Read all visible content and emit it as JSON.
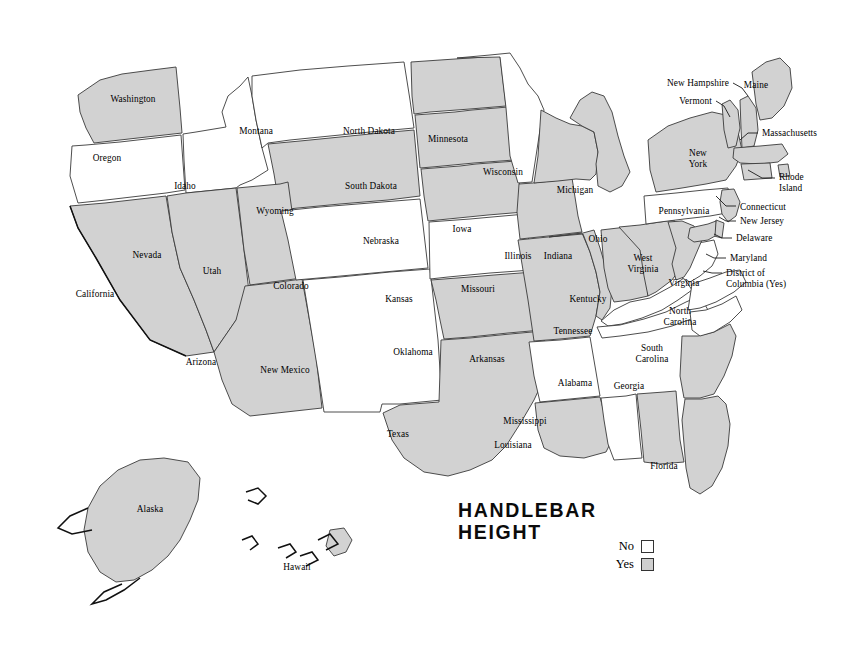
{
  "title": {
    "line1": "HANDLEBAR",
    "line2": "HEIGHT"
  },
  "legend": {
    "no_label": "No",
    "yes_label": "Yes",
    "no_color": "#ffffff",
    "yes_color": "#cfcfcf"
  },
  "colors": {
    "yes_fill": "#d2d2d2",
    "no_fill": "#ffffff",
    "border": "#3a3a3a",
    "background": "#ffffff"
  },
  "map_data": {
    "type": "choropleth",
    "region": "United States",
    "categories": [
      "No",
      "Yes"
    ],
    "states": [
      {
        "code": "WA",
        "label": "Washington",
        "value": "Yes",
        "lx": 133,
        "ly": 94,
        "align": "c"
      },
      {
        "code": "OR",
        "label": "Oregon",
        "value": "No",
        "lx": 107,
        "ly": 153,
        "align": "c"
      },
      {
        "code": "ID",
        "label": "Idaho",
        "value": "No",
        "lx": 185,
        "ly": 181,
        "align": "c"
      },
      {
        "code": "MT",
        "label": "Montana",
        "value": "No",
        "lx": 256,
        "ly": 126,
        "align": "c"
      },
      {
        "code": "WY",
        "label": "Wyoming",
        "value": "Yes",
        "lx": 275,
        "ly": 206,
        "align": "c"
      },
      {
        "code": "CA",
        "label": "California",
        "value": "Yes",
        "lx": 95,
        "ly": 289,
        "align": "c"
      },
      {
        "code": "NV",
        "label": "Nevada",
        "value": "Yes",
        "lx": 147,
        "ly": 250,
        "align": "c"
      },
      {
        "code": "UT",
        "label": "Utah",
        "value": "Yes",
        "lx": 212,
        "ly": 266,
        "align": "c"
      },
      {
        "code": "AZ",
        "label": "Arizona",
        "value": "Yes",
        "lx": 201,
        "ly": 357,
        "align": "c"
      },
      {
        "code": "NM",
        "label": "New Mexico",
        "value": "No",
        "lx": 285,
        "ly": 365,
        "align": "c"
      },
      {
        "code": "CO",
        "label": "Colorado",
        "value": "No",
        "lx": 291,
        "ly": 281,
        "align": "c"
      },
      {
        "code": "ND",
        "label": "North Dakota",
        "value": "Yes",
        "lx": 369,
        "ly": 126,
        "align": "c"
      },
      {
        "code": "SD",
        "label": "South Dakota",
        "value": "Yes",
        "lx": 371,
        "ly": 181,
        "align": "c"
      },
      {
        "code": "NE",
        "label": "Nebraska",
        "value": "Yes",
        "lx": 381,
        "ly": 236,
        "align": "c"
      },
      {
        "code": "KS",
        "label": "Kansas",
        "value": "No",
        "lx": 399,
        "ly": 294,
        "align": "c"
      },
      {
        "code": "OK",
        "label": "Oklahoma",
        "value": "Yes",
        "lx": 413,
        "ly": 347,
        "align": "c"
      },
      {
        "code": "TX",
        "label": "Texas",
        "value": "Yes",
        "lx": 398,
        "ly": 429,
        "align": "c"
      },
      {
        "code": "MN",
        "label": "Minnesota",
        "value": "No",
        "lx": 448,
        "ly": 134,
        "align": "c"
      },
      {
        "code": "IA",
        "label": "Iowa",
        "value": "Yes",
        "lx": 462,
        "ly": 224,
        "align": "c"
      },
      {
        "code": "MO",
        "label": "Missouri",
        "value": "Yes",
        "lx": 478,
        "ly": 284,
        "align": "c"
      },
      {
        "code": "AR",
        "label": "Arkansas",
        "value": "No",
        "lx": 487,
        "ly": 354,
        "align": "c"
      },
      {
        "code": "LA",
        "label": "Louisiana",
        "value": "Yes",
        "lx": 513,
        "ly": 440,
        "align": "c"
      },
      {
        "code": "MS",
        "label": "Mississippi",
        "value": "No",
        "lx": 525,
        "ly": 416,
        "align": "c"
      },
      {
        "code": "WI",
        "label": "Wisconsin",
        "value": "Yes",
        "lx": 503,
        "ly": 167,
        "align": "c"
      },
      {
        "code": "IL",
        "label": "Illinois",
        "value": "Yes",
        "lx": 518,
        "ly": 251,
        "align": "c"
      },
      {
        "code": "MI",
        "label": "Michigan",
        "value": "Yes",
        "lx": 575,
        "ly": 185,
        "align": "c"
      },
      {
        "code": "IN",
        "label": "Indiana",
        "value": "Yes",
        "lx": 558,
        "ly": 251,
        "align": "c"
      },
      {
        "code": "OH",
        "label": "Ohio",
        "value": "Yes",
        "lx": 598,
        "ly": 234,
        "align": "c"
      },
      {
        "code": "KY",
        "label": "Kentucky",
        "value": "No",
        "lx": 588,
        "ly": 294,
        "align": "c"
      },
      {
        "code": "TN",
        "label": "Tennessee",
        "value": "No",
        "lx": 573,
        "ly": 326,
        "align": "c"
      },
      {
        "code": "AL",
        "label": "Alabama",
        "value": "Yes",
        "lx": 575,
        "ly": 378,
        "align": "c"
      },
      {
        "code": "GA",
        "label": "Georgia",
        "value": "Yes",
        "lx": 629,
        "ly": 381,
        "align": "c"
      },
      {
        "code": "FL",
        "label": "Florida",
        "value": "Yes",
        "lx": 664,
        "ly": 461,
        "align": "c"
      },
      {
        "code": "SC",
        "label": "South\nCarolina",
        "value": "No",
        "lx": 652,
        "ly": 343,
        "align": "c"
      },
      {
        "code": "NC",
        "label": "North\nCarolina",
        "value": "No",
        "lx": 680,
        "ly": 306,
        "align": "c"
      },
      {
        "code": "VA",
        "label": "Virginia",
        "value": "No",
        "lx": 684,
        "ly": 278,
        "align": "c"
      },
      {
        "code": "WV",
        "label": "West\nVirginia",
        "value": "Yes",
        "lx": 643,
        "ly": 253,
        "align": "c"
      },
      {
        "code": "PA",
        "label": "Pennsylvania",
        "value": "No",
        "lx": 684,
        "ly": 206,
        "align": "c"
      },
      {
        "code": "NY",
        "label": "New\nYork",
        "value": "Yes",
        "lx": 698,
        "ly": 148,
        "align": "c"
      },
      {
        "code": "AK",
        "label": "Alaska",
        "value": "Yes",
        "lx": 150,
        "ly": 504,
        "align": "c"
      },
      {
        "code": "HI",
        "label": "Hawaii",
        "value": "Yes",
        "lx": 297,
        "ly": 562,
        "align": "c"
      }
    ],
    "callouts": [
      {
        "code": "NH",
        "label": "New Hampshire",
        "value": "Yes",
        "lx": 729,
        "ly": 78,
        "align": "r",
        "lead": "M733,83 L742,88 L748,96"
      },
      {
        "code": "VT",
        "label": "Vermont",
        "value": "Yes",
        "lx": 712,
        "ly": 96,
        "align": "r",
        "lead": "M716,101 L724,106 L730,117"
      },
      {
        "code": "ME",
        "label": "Maine",
        "value": "Yes",
        "lx": 756,
        "ly": 80,
        "align": "c"
      },
      {
        "code": "MA",
        "label": "Massachusetts",
        "value": "Yes",
        "lx": 762,
        "ly": 128,
        "align": "l",
        "lead": "M758,133 L748,133 L740,140"
      },
      {
        "code": "RI",
        "label": "Rhode\nIsland",
        "value": "Yes",
        "lx": 779,
        "ly": 172,
        "align": "l",
        "lead": "M775,178 L762,178 L748,170"
      },
      {
        "code": "CT",
        "label": "Connecticut",
        "value": "Yes",
        "lx": 740,
        "ly": 202,
        "align": "l",
        "lead": "M736,206 L726,206 L716,196"
      },
      {
        "code": "NJ",
        "label": "New Jersey",
        "value": "Yes",
        "lx": 740,
        "ly": 216,
        "align": "l",
        "lead": "M736,221 L726,221 L719,217"
      },
      {
        "code": "DE",
        "label": "Delaware",
        "value": "Yes",
        "lx": 736,
        "ly": 233,
        "align": "l",
        "lead": "M732,238 L722,238 L714,234"
      },
      {
        "code": "MD",
        "label": "Maryland",
        "value": "Yes",
        "lx": 730,
        "ly": 253,
        "align": "l",
        "lead": "M726,258 L714,258 L706,254"
      },
      {
        "code": "DC",
        "label": "District of\nColumbia (Yes)",
        "value": "Yes",
        "lx": 726,
        "ly": 268,
        "align": "l",
        "lead": "M722,273 L712,273 L703,271"
      }
    ]
  }
}
